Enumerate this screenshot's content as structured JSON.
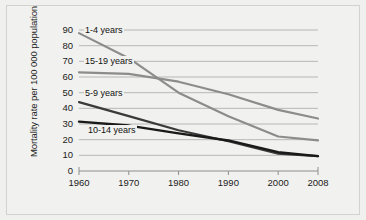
{
  "figure": {
    "background_color": "#f1f1ef",
    "border_color": "#d2d2cf",
    "grid_color": "#a8a8a6"
  },
  "chart_data": {
    "type": "line",
    "title": "",
    "xlabel": "",
    "ylabel": "Mortality rate per 100 000 population",
    "x": [
      1960,
      1970,
      1980,
      1990,
      2000,
      2008
    ],
    "xticklabels": [
      "1960",
      "1970",
      "1980",
      "1990",
      "2000",
      "2008"
    ],
    "xlim": [
      1960,
      2008
    ],
    "ylim": [
      0,
      90
    ],
    "yticks": [
      0,
      10,
      20,
      30,
      40,
      50,
      60,
      70,
      80,
      90
    ],
    "yticklabels": [
      "0",
      "10",
      "20",
      "30",
      "40",
      "50",
      "60",
      "70",
      "80",
      "90"
    ],
    "grid": true,
    "legend": "inline-labels",
    "series": [
      {
        "name": "1-4 years",
        "color": "#8c8c8c",
        "width": 2.2,
        "values": [
          88,
          72,
          50,
          35,
          22,
          19.5
        ]
      },
      {
        "name": "15-19 years",
        "color": "#8c8c8c",
        "width": 2.2,
        "values": [
          63,
          62,
          57,
          49,
          39,
          33.5
        ]
      },
      {
        "name": "5-9 years",
        "color": "#3a3a3a",
        "width": 2.2,
        "values": [
          44,
          35,
          26,
          19,
          11,
          9.5
        ]
      },
      {
        "name": "10-14 years",
        "color": "#1a1a1a",
        "width": 2.4,
        "values": [
          31.5,
          29,
          24,
          19.5,
          12,
          9.5
        ]
      }
    ]
  },
  "labels": {
    "s1": "1-4 years",
    "s2": "15-19 years",
    "s3": "5-9 years",
    "s4": "10-14 years"
  }
}
